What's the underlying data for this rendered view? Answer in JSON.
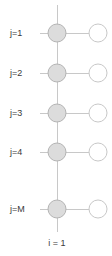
{
  "figure": {
    "type": "lattice-node-diagram",
    "width": 112,
    "height": 256,
    "background_color": "#ffffff"
  },
  "colors": {
    "line": "#c8c8c8",
    "node_fill_filled": "#dcdcdc",
    "node_stroke_filled": "#b4b4b4",
    "node_fill_empty": "#ffffff",
    "node_stroke_empty": "#c8c8c8",
    "text": "#3a3a3a"
  },
  "geometry": {
    "column_x": [
      57,
      98
    ],
    "row_y": [
      33,
      73,
      113,
      152,
      209
    ],
    "node_radius": 9,
    "stub_left_x": 40,
    "spine_top_y": 5,
    "spine_bottom_y": 232
  },
  "row_labels": [
    {
      "text": "j=1",
      "x": 10,
      "y": 33
    },
    {
      "text": "j=2",
      "x": 10,
      "y": 73
    },
    {
      "text": "j=3",
      "x": 10,
      "y": 113
    },
    {
      "text": "j=4",
      "x": 10,
      "y": 152
    },
    {
      "text": "j=M",
      "x": 10,
      "y": 209
    }
  ],
  "axis_labels": [
    {
      "text": "i = 1",
      "x": 57,
      "y": 243
    }
  ],
  "nodes": [
    {
      "row": 0,
      "col": 0,
      "state": "filled"
    },
    {
      "row": 0,
      "col": 1,
      "state": "empty"
    },
    {
      "row": 1,
      "col": 0,
      "state": "filled"
    },
    {
      "row": 1,
      "col": 1,
      "state": "empty"
    },
    {
      "row": 2,
      "col": 0,
      "state": "filled"
    },
    {
      "row": 2,
      "col": 1,
      "state": "empty"
    },
    {
      "row": 3,
      "col": 0,
      "state": "filled"
    },
    {
      "row": 3,
      "col": 1,
      "state": "empty"
    },
    {
      "row": 4,
      "col": 0,
      "state": "filled"
    },
    {
      "row": 4,
      "col": 1,
      "state": "empty"
    }
  ]
}
